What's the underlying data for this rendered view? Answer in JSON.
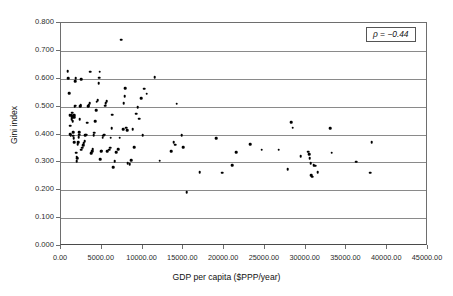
{
  "chart_data": {
    "type": "scatter",
    "title": "",
    "xlabel": "GDP per capita ($PPP/year)",
    "ylabel": "Gini index",
    "xlim": [
      0,
      45000
    ],
    "ylim": [
      0.0,
      0.8
    ],
    "grid": "horizontal",
    "legend": "none",
    "annotations": [
      {
        "name": "correlation-box",
        "text": "ρ = −0.44"
      }
    ],
    "xticks": [
      0,
      5000,
      10000,
      15000,
      20000,
      25000,
      30000,
      35000,
      40000,
      45000
    ],
    "xticklabels": [
      "0.00",
      "5000.00",
      "10000.00",
      "15000.00",
      "20000.00",
      "25000.00",
      "30000.00",
      "35000.00",
      "40000.00",
      "45000.00"
    ],
    "yticks": [
      0.0,
      0.1,
      0.2,
      0.3,
      0.4,
      0.5,
      0.6,
      0.7,
      0.8
    ],
    "yticklabels": [
      "0.000",
      "0.100",
      "0.200",
      "0.300",
      "0.400",
      "0.500",
      "0.600",
      "0.700",
      "0.800"
    ],
    "series": [
      {
        "name": "countries",
        "marker": "filled-circle",
        "color": "#000000",
        "points": [
          [
            800,
            0.627
          ],
          [
            900,
            0.603
          ],
          [
            1000,
            0.548
          ],
          [
            1050,
            0.47
          ],
          [
            1100,
            0.432
          ],
          [
            1150,
            0.401
          ],
          [
            1200,
            0.398
          ],
          [
            1250,
            0.47
          ],
          [
            1300,
            0.463
          ],
          [
            1320,
            0.455
          ],
          [
            1350,
            0.478
          ],
          [
            1400,
            0.468
          ],
          [
            1420,
            0.462
          ],
          [
            1450,
            0.448
          ],
          [
            1480,
            0.408
          ],
          [
            1500,
            0.396
          ],
          [
            1550,
            0.387
          ],
          [
            1600,
            0.373
          ],
          [
            1620,
            0.462
          ],
          [
            1650,
            0.47
          ],
          [
            1700,
            0.5
          ],
          [
            1720,
            0.504
          ],
          [
            1750,
            0.592
          ],
          [
            1800,
            0.602
          ],
          [
            1850,
            0.335
          ],
          [
            1900,
            0.32
          ],
          [
            1950,
            0.305
          ],
          [
            2000,
            0.316
          ],
          [
            2050,
            0.366
          ],
          [
            2100,
            0.372
          ],
          [
            2150,
            0.39
          ],
          [
            2200,
            0.4
          ],
          [
            2250,
            0.408
          ],
          [
            2300,
            0.455
          ],
          [
            2350,
            0.502
          ],
          [
            2400,
            0.506
          ],
          [
            2450,
            0.599
          ],
          [
            2500,
            0.345
          ],
          [
            2600,
            0.352
          ],
          [
            2700,
            0.362
          ],
          [
            2800,
            0.368
          ],
          [
            2900,
            0.377
          ],
          [
            3000,
            0.398
          ],
          [
            3100,
            0.4
          ],
          [
            3200,
            0.443
          ],
          [
            3300,
            0.502
          ],
          [
            3400,
            0.506
          ],
          [
            3500,
            0.512
          ],
          [
            3600,
            0.626
          ],
          [
            3700,
            0.332
          ],
          [
            3800,
            0.34
          ],
          [
            3900,
            0.348
          ],
          [
            4000,
            0.398
          ],
          [
            4100,
            0.406
          ],
          [
            4200,
            0.448
          ],
          [
            4300,
            0.487
          ],
          [
            4400,
            0.517
          ],
          [
            4500,
            0.523
          ],
          [
            4600,
            0.583
          ],
          [
            4700,
            0.604
          ],
          [
            4750,
            0.625
          ],
          [
            4800,
            0.311
          ],
          [
            4900,
            0.34
          ],
          [
            5000,
            0.342
          ],
          [
            5100,
            0.389
          ],
          [
            5200,
            0.395
          ],
          [
            5300,
            0.4
          ],
          [
            5400,
            0.503
          ],
          [
            5500,
            0.512
          ],
          [
            5600,
            0.519
          ],
          [
            5700,
            0.341
          ],
          [
            5900,
            0.345
          ],
          [
            6000,
            0.352
          ],
          [
            6100,
            0.388
          ],
          [
            6200,
            0.422
          ],
          [
            6300,
            0.471
          ],
          [
            6400,
            0.282
          ],
          [
            6600,
            0.304
          ],
          [
            6800,
            0.336
          ],
          [
            7000,
            0.348
          ],
          [
            7200,
            0.388
          ],
          [
            7400,
            0.74
          ],
          [
            7600,
            0.419
          ],
          [
            7700,
            0.512
          ],
          [
            7800,
            0.538
          ],
          [
            7900,
            0.567
          ],
          [
            8000,
            0.424
          ],
          [
            8100,
            0.415
          ],
          [
            8200,
            0.298
          ],
          [
            8400,
            0.293
          ],
          [
            8600,
            0.307
          ],
          [
            8800,
            0.418
          ],
          [
            9000,
            0.355
          ],
          [
            9200,
            0.475
          ],
          [
            9400,
            0.497
          ],
          [
            9600,
            0.456
          ],
          [
            9800,
            0.53
          ],
          [
            10000,
            0.397
          ],
          [
            10200,
            0.564
          ],
          [
            10500,
            0.547
          ],
          [
            11500,
            0.606
          ],
          [
            12100,
            0.306
          ],
          [
            13500,
            0.34
          ],
          [
            13800,
            0.372
          ],
          [
            14000,
            0.363
          ],
          [
            14200,
            0.51
          ],
          [
            14800,
            0.398
          ],
          [
            15000,
            0.355
          ],
          [
            15400,
            0.193
          ],
          [
            17000,
            0.265
          ],
          [
            19000,
            0.387
          ],
          [
            19800,
            0.263
          ],
          [
            21000,
            0.29
          ],
          [
            21500,
            0.336
          ],
          [
            23200,
            0.365
          ],
          [
            24600,
            0.345
          ],
          [
            26700,
            0.345
          ],
          [
            27800,
            0.275
          ],
          [
            28200,
            0.444
          ],
          [
            28400,
            0.424
          ],
          [
            29400,
            0.323
          ],
          [
            30300,
            0.338
          ],
          [
            30400,
            0.33
          ],
          [
            30500,
            0.315
          ],
          [
            30600,
            0.298
          ],
          [
            30700,
            0.255
          ],
          [
            30800,
            0.248
          ],
          [
            31000,
            0.29
          ],
          [
            31200,
            0.288
          ],
          [
            31500,
            0.265
          ],
          [
            33000,
            0.423
          ],
          [
            33200,
            0.334
          ],
          [
            36200,
            0.303
          ],
          [
            37900,
            0.263
          ],
          [
            38100,
            0.372
          ]
        ]
      }
    ]
  },
  "axes": {
    "x_title": "GDP per capita ($PPP/year)",
    "y_title": "Gini index"
  }
}
